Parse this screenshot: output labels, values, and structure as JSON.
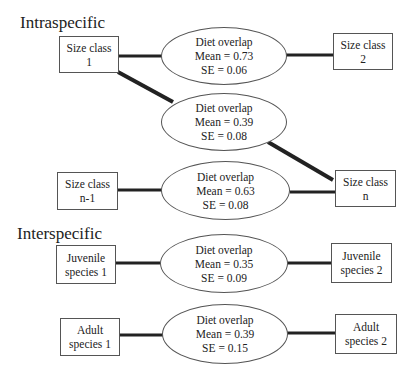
{
  "sections": {
    "intraspecific": "Intraspecific",
    "interspecific": "Interspecific"
  },
  "nodes": {
    "sc1": [
      "Size class",
      "1"
    ],
    "sc2": [
      "Size class",
      "2"
    ],
    "scn1": [
      "Size class",
      "n-1"
    ],
    "scn": [
      "Size class",
      "n"
    ],
    "juv1": [
      "Juvenile",
      "species 1"
    ],
    "juv2": [
      "Juvenile",
      "species 2"
    ],
    "ad1": [
      "Adult",
      "species 1"
    ],
    "ad2": [
      "Adult",
      "species 2"
    ]
  },
  "overlaps": [
    {
      "label": "Diet overlap",
      "mean": "Mean = 0.73",
      "se": "SE = 0.06",
      "from": "Size class 1",
      "to": "Size class 2"
    },
    {
      "label": "Diet overlap",
      "mean": "Mean = 0.39",
      "se": "SE = 0.08",
      "from": "Size class 1",
      "to": "Size class n"
    },
    {
      "label": "Diet overlap",
      "mean": "Mean = 0.63",
      "se": "SE = 0.08",
      "from": "Size class n-1",
      "to": "Size class n"
    },
    {
      "label": "Diet overlap",
      "mean": "Mean = 0.35",
      "se": "SE = 0.09",
      "from": "Juvenile species 1",
      "to": "Juvenile species 2"
    },
    {
      "label": "Diet overlap",
      "mean": "Mean = 0.39",
      "se": "SE = 0.15",
      "from": "Adult species 1",
      "to": "Adult species 2"
    }
  ]
}
